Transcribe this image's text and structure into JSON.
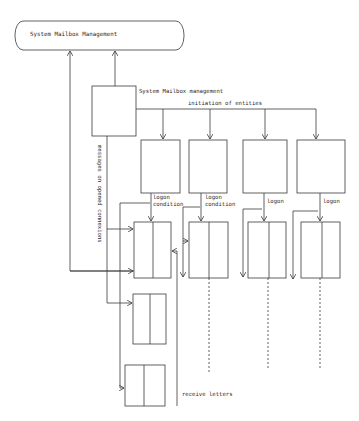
{
  "diagram": {
    "top_node": {
      "label": "System Mailbox Management"
    },
    "manager_node": {
      "label": "System Mailbox management"
    },
    "edges": {
      "initiation": "initiation of entities",
      "logon_condition_1": "logon condition",
      "logon_condition_2": "logon condition",
      "logon_3": "logon",
      "logon_4": "logon",
      "messages": "messages on opened connexions",
      "receive": "receive letters"
    },
    "entity_boxes": 4,
    "mailbox_boxes": 6,
    "colors": {
      "line": "#3a3a3a",
      "text": "#2a2a2a",
      "background": "#ffffff"
    }
  }
}
